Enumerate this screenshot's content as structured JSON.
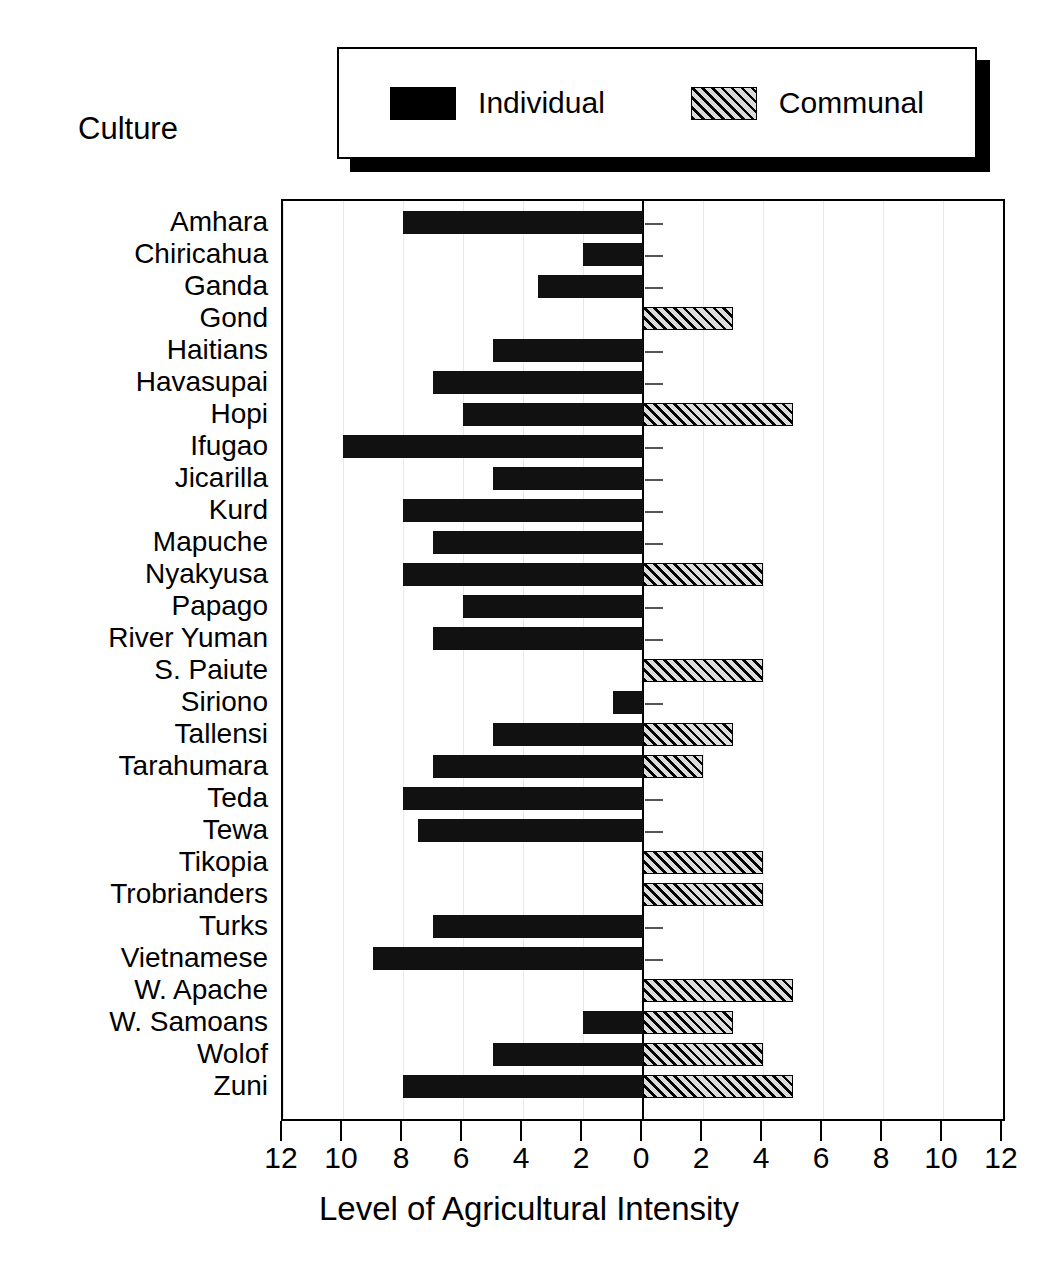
{
  "legend": {
    "entries": [
      {
        "label": "Individual",
        "swatch": "solid-black-square",
        "color": "#000000"
      },
      {
        "label": "Communal",
        "swatch": "hatched-square",
        "color": "#808080"
      }
    ]
  },
  "axes": {
    "category_axis_title": "Culture",
    "value_axis_title": "Level of Agricultural Intensity",
    "value_ticks": [
      12,
      10,
      8,
      6,
      4,
      2,
      0,
      2,
      4,
      6,
      8,
      10,
      12
    ],
    "value_tick_labels": [
      "12",
      "10",
      "8",
      "6",
      "4",
      "2",
      "0",
      "2",
      "4",
      "6",
      "8",
      "10",
      "12"
    ]
  },
  "chart_data": {
    "type": "bar",
    "title": "",
    "subtitle": "",
    "xlabel": "Level of Agricultural Intensity",
    "ylabel": "Culture",
    "orientation": "horizontal",
    "layout": "diverging-bidirectional",
    "grid": true,
    "legend_position": "top",
    "xlim": [
      -12,
      12
    ],
    "xticks": [
      -12,
      -10,
      -8,
      -6,
      -4,
      -2,
      0,
      2,
      4,
      6,
      8,
      10,
      12
    ],
    "xticklabels": [
      "12",
      "10",
      "8",
      "6",
      "4",
      "2",
      "0",
      "2",
      "4",
      "6",
      "8",
      "10",
      "12"
    ],
    "categories": [
      "Amhara",
      "Chiricahua",
      "Ganda",
      "Gond",
      "Haitians",
      "Havasupai",
      "Hopi",
      "Ifugao",
      "Jicarilla",
      "Kurd",
      "Mapuche",
      "Nyakyusa",
      "Papago",
      "River Yuman",
      "S. Paiute",
      "Siriono",
      "Tallensi",
      "Tarahumara",
      "Teda",
      "Tewa",
      "Tikopia",
      "Trobrianders",
      "Turks",
      "Vietnamese",
      "W. Apache",
      "W. Samoans",
      "Wolof",
      "Zuni"
    ],
    "series": [
      {
        "name": "Individual",
        "direction": "left",
        "values": [
          8,
          2,
          3.5,
          0,
          5,
          7,
          6,
          10,
          5,
          8,
          7,
          8,
          6,
          7,
          0,
          1,
          5,
          7,
          8,
          7.5,
          0,
          0,
          7,
          9,
          0,
          2,
          5,
          8
        ]
      },
      {
        "name": "Communal",
        "direction": "right",
        "values": [
          0,
          0,
          0,
          3,
          0,
          0,
          5,
          0,
          0,
          0,
          0,
          4,
          0,
          0,
          4,
          0,
          3,
          2,
          0,
          0,
          4,
          4,
          0,
          0,
          5,
          3,
          4,
          5
        ]
      }
    ]
  }
}
